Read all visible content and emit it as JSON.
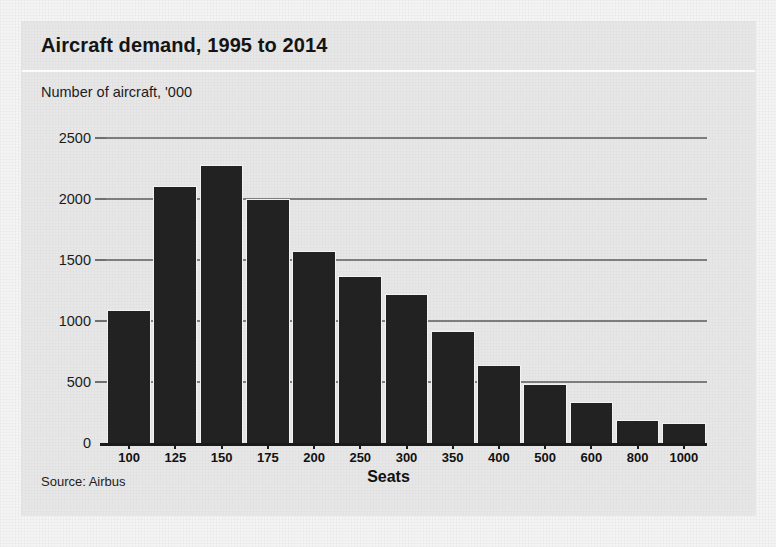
{
  "card": {
    "title": "Aircraft demand, 1995 to 2014",
    "subtitle": "Number of aircraft, '000",
    "source": "Source: Airbus"
  },
  "colors": {
    "bar": "#222222",
    "card_background": "#e7e7e7",
    "page_background": "#f4f4f4",
    "gridline": "#7d7d7d",
    "axis": "#1a1a1a",
    "text": "#141414"
  },
  "chart_data": {
    "type": "bar",
    "title": "Aircraft demand, 1995 to 2014",
    "subtitle": "Number of aircraft, '000",
    "xlabel": "Seats",
    "ylabel": "Number of aircraft, '000",
    "source": "Source: Airbus",
    "categories": [
      "100",
      "125",
      "150",
      "175",
      "200",
      "250",
      "300",
      "350",
      "400",
      "500",
      "600",
      "800",
      "1000"
    ],
    "values": [
      1090,
      2110,
      2280,
      2000,
      1570,
      1370,
      1220,
      920,
      640,
      480,
      340,
      190,
      165
    ],
    "ylim": [
      0,
      2500
    ],
    "yticks": [
      0,
      500,
      1000,
      1500,
      2000,
      2500
    ],
    "ytick_labels": [
      "0",
      "500",
      "1000",
      "1500",
      "2000",
      "2500"
    ],
    "grid": true,
    "legend": "none"
  }
}
